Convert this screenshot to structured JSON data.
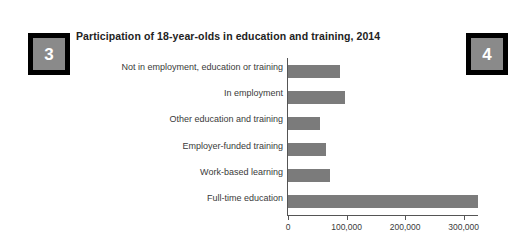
{
  "badges": {
    "left": "3",
    "right": "4"
  },
  "chart_data": {
    "type": "bar",
    "orientation": "horizontal",
    "title": "Participation of 18-year-olds in education and training, 2014",
    "xlabel": "",
    "ylabel": "",
    "categories": [
      "Not in employment, education or training",
      "In employment",
      "Other education and training",
      "Employer-funded training",
      "Work-based learning",
      "Full-time education"
    ],
    "values": [
      88000,
      97000,
      55000,
      65000,
      72000,
      325000
    ],
    "xlim": [
      0,
      333000
    ],
    "xticks": [
      0,
      100000,
      200000,
      300000
    ],
    "xtick_labels": [
      "0",
      "100,000",
      "200,000",
      "300,000"
    ],
    "grid": false,
    "legend": false,
    "bar_color": "#7b7b7b",
    "axis_color": "#555555"
  }
}
